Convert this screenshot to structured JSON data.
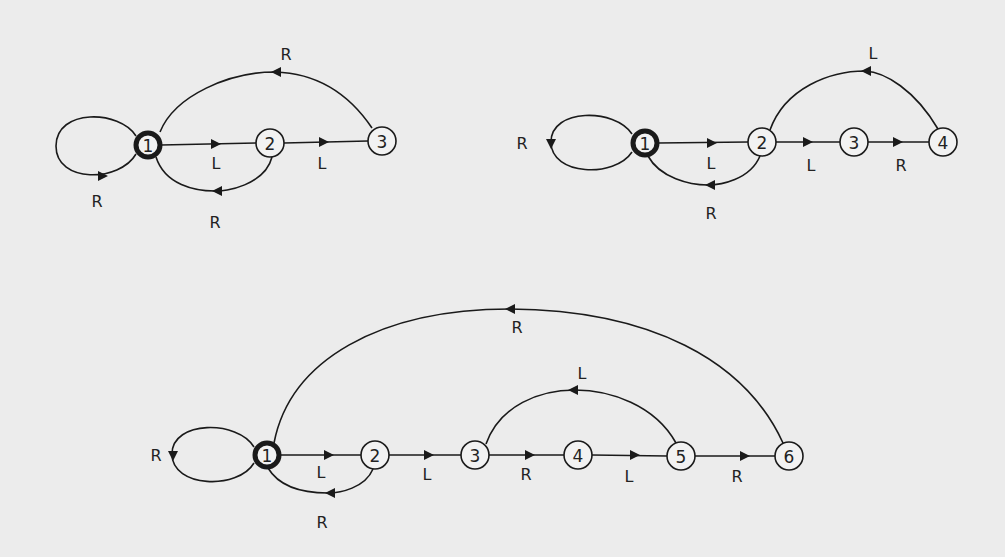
{
  "diagram": {
    "type": "state-transition-graphs",
    "background": "#ececec",
    "ink": "#1a1a1a",
    "graphs": [
      {
        "id": "graph-a",
        "nodes": [
          {
            "label": "1",
            "x": 148,
            "y": 145,
            "start": true
          },
          {
            "label": "2",
            "x": 270,
            "y": 143,
            "start": false
          },
          {
            "label": "3",
            "x": 382,
            "y": 141,
            "start": false
          }
        ],
        "edges": [
          {
            "from": "1",
            "to": "1",
            "label": "R",
            "kind": "self-loop"
          },
          {
            "from": "1",
            "to": "2",
            "label": "L"
          },
          {
            "from": "2",
            "to": "3",
            "label": "L"
          },
          {
            "from": "2",
            "to": "1",
            "label": "R",
            "kind": "lower-arc"
          },
          {
            "from": "3",
            "to": "1",
            "label": "R",
            "kind": "upper-arc"
          }
        ]
      },
      {
        "id": "graph-b",
        "nodes": [
          {
            "label": "1",
            "x": 645,
            "y": 143,
            "start": true
          },
          {
            "label": "2",
            "x": 762,
            "y": 142,
            "start": false
          },
          {
            "label": "3",
            "x": 854,
            "y": 142,
            "start": false
          },
          {
            "label": "4",
            "x": 943,
            "y": 142,
            "start": false
          }
        ],
        "edges": [
          {
            "from": "1",
            "to": "1",
            "label": "R",
            "kind": "self-loop"
          },
          {
            "from": "1",
            "to": "2",
            "label": "L"
          },
          {
            "from": "2",
            "to": "3",
            "label": "L"
          },
          {
            "from": "3",
            "to": "4",
            "label": "R"
          },
          {
            "from": "2",
            "to": "1",
            "label": "R",
            "kind": "lower-arc"
          },
          {
            "from": "4",
            "to": "2",
            "label": "L",
            "kind": "upper-arc"
          }
        ]
      },
      {
        "id": "graph-c",
        "nodes": [
          {
            "label": "1",
            "x": 267,
            "y": 455,
            "start": true
          },
          {
            "label": "2",
            "x": 375,
            "y": 455,
            "start": false
          },
          {
            "label": "3",
            "x": 475,
            "y": 455,
            "start": false
          },
          {
            "label": "4",
            "x": 578,
            "y": 455,
            "start": false
          },
          {
            "label": "5",
            "x": 681,
            "y": 456,
            "start": false
          },
          {
            "label": "6",
            "x": 789,
            "y": 456,
            "start": false
          }
        ],
        "edges": [
          {
            "from": "1",
            "to": "1",
            "label": "R",
            "kind": "self-loop"
          },
          {
            "from": "1",
            "to": "2",
            "label": "L"
          },
          {
            "from": "2",
            "to": "3",
            "label": "L"
          },
          {
            "from": "3",
            "to": "4",
            "label": "R"
          },
          {
            "from": "4",
            "to": "5",
            "label": "L"
          },
          {
            "from": "5",
            "to": "6",
            "label": "R"
          },
          {
            "from": "2",
            "to": "1",
            "label": "R",
            "kind": "lower-arc"
          },
          {
            "from": "5",
            "to": "3",
            "label": "L",
            "kind": "upper-arc"
          },
          {
            "from": "6",
            "to": "1",
            "label": "R",
            "kind": "upper-arc"
          }
        ]
      }
    ]
  },
  "labels": {
    "a": {
      "n1": "1",
      "n2": "2",
      "n3": "3",
      "loop": "R",
      "e12": "L",
      "e23": "L",
      "e21": "R",
      "e31": "R"
    },
    "b": {
      "n1": "1",
      "n2": "2",
      "n3": "3",
      "n4": "4",
      "loop": "R",
      "e12": "L",
      "e23": "L",
      "e34": "R",
      "e21": "R",
      "e42": "L"
    },
    "c": {
      "n1": "1",
      "n2": "2",
      "n3": "3",
      "n4": "4",
      "n5": "5",
      "n6": "6",
      "loop": "R",
      "e12": "L",
      "e23": "L",
      "e34": "R",
      "e45": "L",
      "e56": "R",
      "e21": "R",
      "e53": "L",
      "e61": "R"
    }
  }
}
